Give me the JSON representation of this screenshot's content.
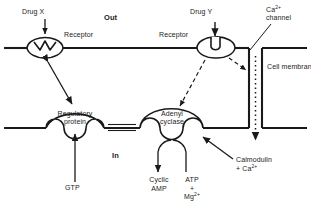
{
  "diagram": {
    "compartments": {
      "outside": "Out",
      "inside": "In"
    },
    "membrane": {
      "label": "Cell membrane"
    },
    "channel": {
      "label_line1": "Ca",
      "label_sup": "2+",
      "label_line2": "channel"
    },
    "ligands": {
      "drug_x": "Drug X",
      "drug_y": "Drug Y"
    },
    "receptors": {
      "left": "Receptor",
      "right": "Receptor"
    },
    "proteins": {
      "regulatory_line1": "Regulatory",
      "regulatory_line2": "protein",
      "cyclase_line1": "Adenyl",
      "cyclase_line2": "cyclase"
    },
    "substrates": {
      "gtp": "GTP",
      "camp_line1": "Cyclic",
      "camp_line2": "AMP",
      "atp_line1": "ATP",
      "atp_plus": "+",
      "atp_mg": "Mg",
      "atp_mg_sup": "2+"
    },
    "calmodulin": {
      "line1": "Calmodulin",
      "line2_plus": "+ Ca",
      "line2_sup": "2+"
    },
    "colors": {
      "ink": "#1a1a1a",
      "background": "#ffffff"
    }
  }
}
